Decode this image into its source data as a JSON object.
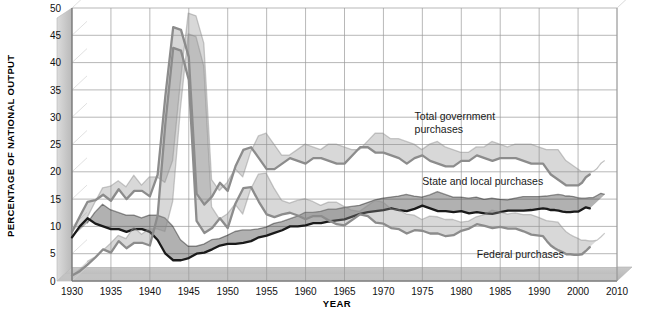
{
  "chart_data": {
    "type": "line",
    "title": "",
    "xlabel": "YEAR",
    "ylabel": "PERCENTAGE OF NATIONAL OUTPUT",
    "xlim": [
      1930,
      2010
    ],
    "ylim": [
      0,
      50
    ],
    "grid": true,
    "legend_position": "inline-annotations",
    "x_tick_labels": [
      "1930",
      "1935",
      "1940",
      "1945",
      "1950",
      "1955",
      "1960",
      "1965",
      "1970",
      "1975",
      "1980",
      "1985",
      "1990",
      "2000",
      "2010"
    ],
    "y_tick_labels": [
      "0",
      "5",
      "10",
      "15",
      "20",
      "25",
      "30",
      "35",
      "40",
      "45",
      "50"
    ],
    "x": [
      1930,
      1931,
      1932,
      1933,
      1934,
      1935,
      1936,
      1937,
      1938,
      1939,
      1940,
      1941,
      1942,
      1943,
      1944,
      1945,
      1946,
      1947,
      1948,
      1949,
      1950,
      1951,
      1952,
      1953,
      1954,
      1955,
      1956,
      1957,
      1958,
      1959,
      1960,
      1961,
      1962,
      1963,
      1964,
      1965,
      1966,
      1967,
      1968,
      1969,
      1970,
      1971,
      1972,
      1973,
      1974,
      1975,
      1976,
      1977,
      1978,
      1979,
      1980,
      1981,
      1982,
      1983,
      1984,
      1985,
      1986,
      1987,
      1988,
      1989,
      1990,
      1991,
      1992,
      1993,
      1994,
      1995,
      1996,
      1997,
      1998,
      1999,
      2000,
      2001,
      2002,
      2003
    ],
    "series": [
      {
        "name": "Total government purchases",
        "color": "#8c8c8c",
        "values": [
          9.0,
          11.8,
          14.5,
          14.8,
          15.8,
          14.7,
          16.8,
          15.0,
          16.5,
          16.5,
          15.5,
          19.5,
          34.0,
          46.5,
          46.0,
          41.0,
          16.0,
          14.0,
          15.5,
          18.0,
          16.5,
          21.0,
          24.0,
          24.5,
          22.5,
          20.5,
          20.5,
          21.5,
          22.5,
          22.0,
          21.5,
          22.5,
          22.5,
          22.0,
          21.5,
          21.5,
          23.0,
          24.5,
          24.5,
          23.5,
          23.5,
          23.0,
          22.5,
          21.5,
          22.5,
          23.0,
          22.0,
          21.5,
          21.0,
          21.0,
          22.0,
          22.0,
          23.0,
          22.5,
          22.0,
          22.5,
          22.5,
          22.5,
          22.0,
          21.5,
          21.5,
          21.5,
          20.5,
          19.5,
          19.0,
          18.5,
          18.0,
          17.5,
          17.5,
          17.5,
          17.5,
          18.0,
          19.0,
          19.5
        ]
      },
      {
        "name": "State and local purchases",
        "color": "#1a1a1a",
        "values": [
          8.0,
          10.0,
          11.5,
          10.5,
          10.0,
          9.5,
          9.5,
          9.0,
          9.5,
          9.5,
          9.0,
          7.5,
          5.0,
          3.8,
          3.8,
          4.2,
          5.0,
          5.2,
          5.8,
          6.5,
          6.8,
          6.8,
          7.0,
          7.3,
          8.0,
          8.3,
          8.8,
          9.3,
          10.0,
          10.0,
          10.2,
          10.6,
          10.6,
          10.9,
          11.1,
          11.3,
          11.8,
          12.3,
          12.6,
          12.8,
          13.0,
          13.3,
          13.0,
          12.8,
          13.2,
          13.8,
          13.3,
          12.8,
          12.8,
          12.6,
          12.8,
          12.4,
          12.6,
          12.4,
          12.3,
          12.6,
          12.9,
          12.9,
          12.9,
          13.0,
          13.2,
          13.3,
          13.2,
          13.0,
          13.0,
          12.9,
          12.7,
          12.6,
          12.6,
          12.7,
          12.7,
          13.1,
          13.5,
          13.3
        ]
      },
      {
        "name": "Federal purchases",
        "color": "#8c8c8c",
        "values": [
          1.0,
          1.8,
          3.0,
          4.3,
          5.8,
          5.2,
          7.3,
          6.0,
          7.0,
          7.0,
          6.5,
          12.0,
          29.0,
          42.7,
          42.2,
          36.8,
          11.0,
          8.8,
          9.7,
          11.5,
          9.7,
          14.2,
          17.0,
          17.2,
          14.5,
          12.2,
          11.7,
          12.2,
          12.5,
          12.0,
          11.3,
          11.9,
          11.9,
          11.1,
          10.4,
          10.2,
          11.2,
          12.2,
          11.9,
          10.7,
          10.5,
          9.7,
          9.5,
          8.7,
          9.3,
          9.2,
          8.7,
          8.7,
          8.2,
          8.4,
          9.2,
          9.6,
          10.4,
          10.1,
          9.7,
          9.9,
          9.6,
          9.6,
          9.1,
          8.5,
          8.3,
          8.2,
          7.3,
          6.5,
          6.0,
          5.6,
          5.3,
          4.9,
          4.9,
          4.8,
          4.8,
          4.9,
          5.5,
          6.2
        ]
      }
    ],
    "annotations": [
      {
        "id": "total",
        "text_line1": "Total government",
        "text_line2": "purchases",
        "x": 1974,
        "y": 29.5
      },
      {
        "id": "state_local",
        "text": "State and local purchases",
        "x": 1975,
        "y": 17.5
      },
      {
        "id": "federal",
        "text": "Federal purchases",
        "x": 1982,
        "y": 4.2
      }
    ]
  },
  "axis": {
    "y_title": "PERCENTAGE OF NATIONAL OUTPUT",
    "x_title": "YEAR"
  }
}
